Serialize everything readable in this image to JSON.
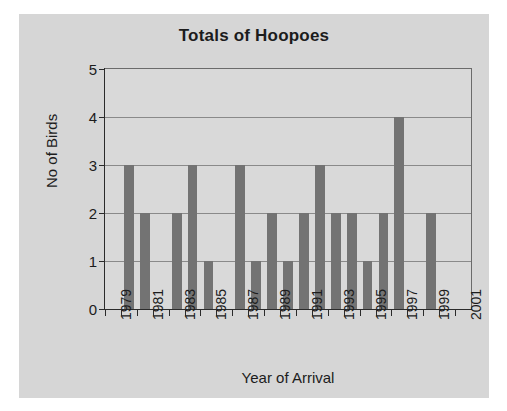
{
  "chart_data": {
    "type": "bar",
    "title": "Totals of Hoopoes",
    "xlabel": "Year of Arrival",
    "ylabel": "No of Birds",
    "ylim": [
      0,
      5
    ],
    "ytick_labels": [
      "0",
      "1",
      "2",
      "3",
      "4",
      "5"
    ],
    "grid": true,
    "legend": null,
    "bar_color": "#737373",
    "plot_background": "#d9d9d9",
    "figure_background": "#d6d6d6",
    "axis_color": "#2b2b2b",
    "gridline_color": "#8a8a8a",
    "categories": [
      "1979",
      "1980",
      "1981",
      "1982",
      "1983",
      "1984",
      "1985",
      "1986",
      "1987",
      "1988",
      "1989",
      "1990",
      "1991",
      "1992",
      "1993",
      "1994",
      "1995",
      "1996",
      "1997",
      "1998",
      "1999",
      "2000",
      "2001"
    ],
    "values": [
      0,
      3,
      2,
      0,
      2,
      3,
      1,
      0,
      3,
      1,
      2,
      1,
      2,
      3,
      2,
      2,
      1,
      2,
      4,
      0,
      2,
      0,
      0
    ],
    "xtick_labels_shown": [
      "1979",
      "1981",
      "1983",
      "1985",
      "1987",
      "1989",
      "1991",
      "1993",
      "1995",
      "1997",
      "1999",
      "2001"
    ]
  }
}
